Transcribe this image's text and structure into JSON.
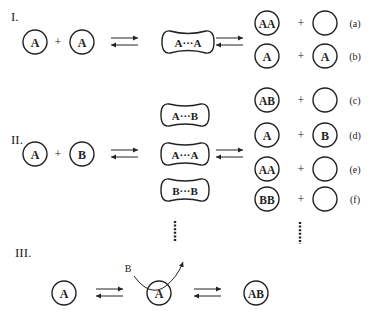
{
  "sections": [
    {
      "label": "I.",
      "reactants": [
        "A",
        "+",
        "A"
      ],
      "intermediates": [
        "A···A"
      ],
      "products": [
        {
          "left": "AA",
          "plus": "+",
          "right": "",
          "tag": "(a)"
        },
        {
          "left": "A",
          "plus": "+",
          "right": "A",
          "tag": "(b)"
        }
      ]
    },
    {
      "label": "II.",
      "reactants": [
        "A",
        "+",
        "B"
      ],
      "intermediates": [
        "A···B",
        "A···A",
        "B···B"
      ],
      "products": [
        {
          "left": "AB",
          "plus": "+",
          "right": "",
          "tag": "(c)"
        },
        {
          "left": "A",
          "plus": "+",
          "right": "B",
          "tag": "(d)"
        },
        {
          "left": "AA",
          "plus": "+",
          "right": "",
          "tag": "(e)"
        },
        {
          "left": "BB",
          "plus": "+",
          "right": "",
          "tag": "(f)"
        }
      ]
    },
    {
      "label": "III.",
      "species": [
        "A",
        "A",
        "AB"
      ],
      "incoming": "B"
    }
  ],
  "colors": {
    "stroke": "#222222",
    "background": "#ffffff"
  }
}
